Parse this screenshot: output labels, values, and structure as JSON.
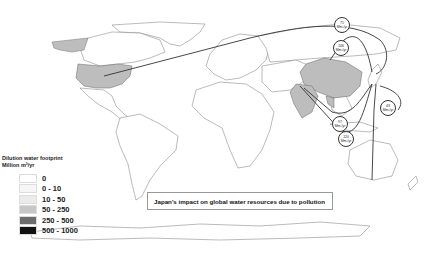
{
  "title": "Japan's impact on global water resources due to pollution",
  "legend": {
    "title_line1": "Dilution water footprint",
    "title_line2": "Million m³/yr",
    "items": [
      {
        "label": "0",
        "color": "#ffffff"
      },
      {
        "label": "0 - 10",
        "color": "#f6f6f6"
      },
      {
        "label": "10 - 50",
        "color": "#ebebeb"
      },
      {
        "label": "50 - 250",
        "color": "#c6c6c6"
      },
      {
        "label": "250 - 500",
        "color": "#6c6c6c"
      },
      {
        "label": "500 - 1000",
        "color": "#111111"
      }
    ]
  },
  "flows": [
    {
      "value": "71",
      "unit": "Mm³/yr",
      "from": "United States"
    },
    {
      "value": "246",
      "unit": "Mm³/yr",
      "from": "China"
    },
    {
      "value": "43",
      "unit": "Mm³/yr",
      "from": "Australia"
    },
    {
      "value": "97",
      "unit": "Mm³/yr",
      "from": "Southeast Asia"
    },
    {
      "value": "120",
      "unit": "Mm³/yr",
      "from": "India"
    }
  ],
  "highlight_colors": {
    "land": "#ffffff",
    "outline": "#666666",
    "shaded_50_250": "#bdbdbd",
    "arrow": "#333333"
  }
}
